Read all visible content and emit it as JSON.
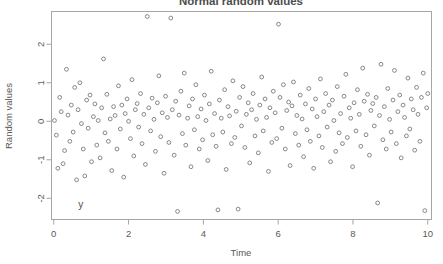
{
  "chart_data": {
    "type": "scatter",
    "title": "Normal random values",
    "xlabel": "Time",
    "ylabel": "Random values",
    "xlim": [
      -0.06,
      10.1
    ],
    "ylim": [
      -2.55,
      2.85
    ],
    "xticks": [
      0,
      2,
      4,
      6,
      8,
      10
    ],
    "yticks": [
      -2,
      -1,
      0,
      1,
      2
    ],
    "xticklabels": [
      "0",
      "2",
      "4",
      "6",
      "8",
      "10"
    ],
    "yticklabels": [
      "-2",
      "-1",
      "0",
      "1",
      "2"
    ],
    "grid": false,
    "legend": null,
    "marker": "open-circle",
    "marker_color": "#7a7a7a",
    "annotations": [
      {
        "text": "y",
        "x": 0.72,
        "y": -2.24
      }
    ],
    "n_points": 200,
    "x": [
      0.02,
      0.07,
      0.11,
      0.16,
      0.2,
      0.25,
      0.29,
      0.34,
      0.38,
      0.43,
      0.47,
      0.52,
      0.56,
      0.61,
      0.65,
      0.7,
      0.74,
      0.79,
      0.83,
      0.88,
      0.92,
      0.97,
      1.01,
      1.06,
      1.1,
      1.15,
      1.19,
      1.24,
      1.28,
      1.33,
      1.37,
      1.42,
      1.46,
      1.51,
      1.55,
      1.6,
      1.64,
      1.69,
      1.73,
      1.78,
      1.82,
      1.87,
      1.91,
      1.96,
      2.0,
      2.05,
      2.09,
      2.14,
      2.18,
      2.23,
      2.27,
      2.32,
      2.36,
      2.41,
      2.45,
      2.5,
      2.54,
      2.59,
      2.63,
      2.68,
      2.72,
      2.77,
      2.81,
      2.86,
      2.9,
      2.95,
      2.99,
      3.04,
      3.08,
      3.13,
      3.17,
      3.22,
      3.26,
      3.31,
      3.35,
      3.4,
      3.44,
      3.49,
      3.53,
      3.58,
      3.62,
      3.67,
      3.71,
      3.76,
      3.8,
      3.85,
      3.89,
      3.94,
      3.98,
      4.03,
      4.07,
      4.12,
      4.16,
      4.21,
      4.25,
      4.3,
      4.34,
      4.39,
      4.43,
      4.48,
      4.52,
      4.57,
      4.61,
      4.66,
      4.7,
      4.75,
      4.79,
      4.84,
      4.88,
      4.93,
      4.97,
      5.02,
      5.06,
      5.11,
      5.15,
      5.2,
      5.24,
      5.29,
      5.33,
      5.38,
      5.42,
      5.47,
      5.51,
      5.56,
      5.6,
      5.65,
      5.69,
      5.74,
      5.78,
      5.83,
      5.87,
      5.92,
      5.96,
      6.01,
      6.05,
      6.1,
      6.14,
      6.19,
      6.23,
      6.28,
      6.32,
      6.37,
      6.41,
      6.46,
      6.5,
      6.55,
      6.59,
      6.64,
      6.68,
      6.73,
      6.77,
      6.82,
      6.86,
      6.91,
      6.95,
      7.0,
      7.04,
      7.09,
      7.13,
      7.18,
      7.22,
      7.27,
      7.31,
      7.36,
      7.4,
      7.45,
      7.49,
      7.54,
      7.58,
      7.63,
      7.67,
      7.72,
      7.76,
      7.81,
      7.85,
      7.9,
      7.94,
      7.99,
      8.03,
      8.08,
      8.12,
      8.17,
      8.21,
      8.26,
      8.3,
      8.35,
      8.39,
      8.44,
      8.48,
      8.53,
      8.57,
      8.62,
      8.66,
      8.71,
      8.75,
      8.8,
      8.84,
      8.89,
      8.93,
      8.98,
      9.02,
      9.07,
      9.11,
      9.16,
      9.2,
      9.25,
      9.29,
      9.34,
      9.38,
      9.43,
      9.47,
      9.52,
      9.56,
      9.61,
      9.65,
      9.7,
      9.74,
      9.79,
      9.83,
      9.88,
      9.92,
      9.97,
      10.0
    ],
    "y": [
      0.02,
      -0.36,
      -1.22,
      0.62,
      0.25,
      -1.1,
      -0.76,
      1.35,
      0.16,
      -0.52,
      0.42,
      -0.28,
      0.88,
      -1.52,
      0.3,
      1.0,
      -0.06,
      -0.72,
      -1.42,
      0.55,
      -0.18,
      0.68,
      -1.05,
      0.12,
      0.45,
      -0.62,
      0.02,
      -0.95,
      0.35,
      1.62,
      -0.3,
      0.7,
      -0.52,
      0.06,
      -1.28,
      0.38,
      0.15,
      -0.72,
      0.92,
      -0.2,
      0.42,
      -1.45,
      0.2,
      0.58,
      0.0,
      -0.45,
      1.08,
      -0.9,
      0.3,
      0.46,
      -0.15,
      0.72,
      -0.58,
      0.18,
      -1.12,
      2.72,
      0.35,
      -0.25,
      0.6,
      0.05,
      -0.78,
      0.48,
      1.18,
      -0.4,
      0.22,
      -1.35,
      0.65,
      0.1,
      -0.55,
      2.68,
      0.3,
      -0.88,
      0.52,
      -2.34,
      0.16,
      0.78,
      -0.32,
      1.25,
      -0.62,
      0.08,
      0.4,
      -1.18,
      0.58,
      -0.22,
      0.95,
      0.12,
      -0.72,
      0.32,
      -0.48,
      0.68,
      0.02,
      -1.02,
      0.45,
      1.3,
      -0.35,
      0.2,
      -0.65,
      -2.3,
      0.55,
      0.08,
      -0.28,
      0.82,
      -1.25,
      0.38,
      0.14,
      -0.58,
      1.05,
      -0.42,
      0.26,
      -2.28,
      0.62,
      -0.12,
      0.9,
      -0.68,
      0.18,
      0.48,
      -1.08,
      0.3,
      0.72,
      -0.38,
      0.05,
      -0.82,
      0.42,
      1.15,
      -0.25,
      0.58,
      0.1,
      -1.3,
      0.35,
      -0.55,
      0.78,
      0.22,
      -0.45,
      2.52,
      0.62,
      -0.18,
      0.95,
      -0.72,
      0.28,
      0.5,
      -1.15,
      0.4,
      1.02,
      -0.32,
      0.15,
      -0.62,
      0.68,
      0.06,
      -0.92,
      0.45,
      -0.22,
      0.85,
      -0.52,
      0.32,
      -1.22,
      0.58,
      0.12,
      -0.38,
      1.1,
      -0.68,
      0.25,
      0.72,
      -0.15,
      0.42,
      -1.05,
      0.55,
      0.02,
      -0.78,
      0.9,
      -0.3,
      0.2,
      -0.58,
      0.65,
      1.22,
      -0.42,
      0.35,
      0.08,
      -1.18,
      0.48,
      -0.25,
      0.82,
      0.18,
      -0.65,
      1.38,
      0.52,
      -0.35,
      0.7,
      -0.88,
      0.28,
      0.46,
      -0.12,
      0.62,
      -2.12,
      0.15,
      1.48,
      -0.48,
      0.38,
      -0.72,
      0.85,
      0.05,
      -0.28,
      0.55,
      1.32,
      -0.58,
      0.25,
      0.68,
      -0.95,
      0.42,
      0.1,
      -0.38,
      1.12,
      -0.2,
      0.58,
      0.3,
      -0.75,
      0.88,
      0.18,
      -0.52,
      0.62,
      1.25,
      -2.32,
      0.35,
      0.72
    ]
  }
}
